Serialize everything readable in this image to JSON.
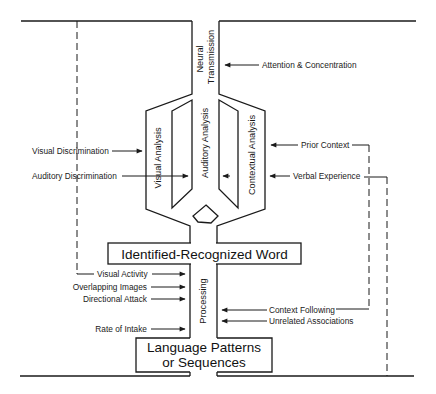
{
  "diagram": {
    "channel_labels": {
      "neural_line1": "Neural",
      "neural_line2": "Transmission",
      "visual_analysis": "Visual Analysis",
      "auditory_analysis": "Auditory Analysis",
      "contextual_analysis": "Contextual Analysis",
      "processing": "Processing"
    },
    "boxes": {
      "identified_word": "Identified-Recognized Word",
      "language_line1": "Language Patterns",
      "language_line2": "or Sequences"
    },
    "inputs_right_top": {
      "attention": "Attention & Concentration",
      "prior_context": "Prior Context",
      "verbal_experience": "Verbal Experience"
    },
    "inputs_left_top": {
      "visual_discrimination": "Visual  Discrimination",
      "auditory_discrimination": "Auditory  Discrimination"
    },
    "inputs_left_bottom": {
      "visual_activity": "Visual Activity",
      "overlapping_images": "Overlapping Images",
      "directional_attack": "Directional Attack",
      "rate_of_intake": "Rate of Intake"
    },
    "inputs_right_bottom": {
      "context_following": "Context Following",
      "unrelated_associations": "Unrelated Associations"
    },
    "colors": {
      "line": "#1a1a1a",
      "background": "#ffffff"
    }
  }
}
